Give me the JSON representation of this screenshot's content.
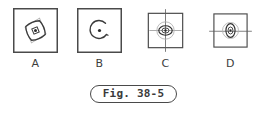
{
  "figure": {
    "caption": "Fig. 38-5",
    "background_color": "#ffffff",
    "ink_color": "#3a3a3a",
    "faint_ink_color": "#9a9a9a",
    "panel_border_color": "#4a4a4a"
  },
  "panels": [
    {
      "id": "A",
      "label": "A",
      "shape_description": "rotated-rhombus-with-center-dot",
      "has_crosshair": false
    },
    {
      "id": "B",
      "label": "B",
      "shape_description": "open-circle-gap-with-center-dot",
      "has_crosshair": false
    },
    {
      "id": "C",
      "label": "C",
      "shape_description": "concentric-circle-and-ellipse-with-center-dot",
      "has_crosshair": true,
      "crosshair_axes": "vertical-and-horizontal"
    },
    {
      "id": "D",
      "label": "D",
      "shape_description": "circle-with-vertical-ellipse-and-center-dot",
      "has_crosshair": true,
      "crosshair_axes": "horizontal"
    }
  ]
}
